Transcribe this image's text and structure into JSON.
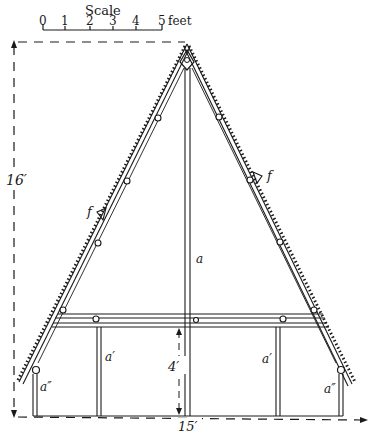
{
  "scale_bar": {
    "title": "Scale",
    "ticks": [
      "0",
      "1",
      "2",
      "3",
      "4",
      "5"
    ],
    "unit": "feet"
  },
  "dimensions": {
    "height_label": "16′",
    "width_label": "15′",
    "wall_height_label": "4′"
  },
  "labels": {
    "center_post": "a",
    "inner_post_left": "a′",
    "inner_post_right": "a′",
    "outer_post_left": "a″",
    "outer_post_right": "a″",
    "bracket_left": "f",
    "bracket_right": "f"
  },
  "colors": {
    "ink": "#1a1a1a",
    "paper": "#ffffff"
  }
}
